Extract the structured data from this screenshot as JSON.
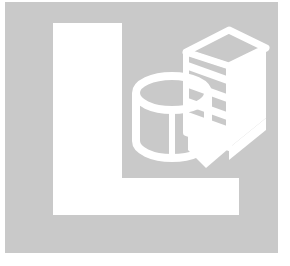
{
  "image": {
    "kind": "logo-graphic",
    "title": "L monogram with database cylinder and server tower",
    "width": 290,
    "height": 266,
    "page_background": "#ffffff"
  },
  "colors": {
    "page_background": "#ffffff",
    "plaque_gray": "#c9c9c9",
    "glyph_white": "#ffffff",
    "outline_white": "#ffffff"
  },
  "plaque": {
    "name": "gray-square-plaque",
    "x": 5,
    "y": 2,
    "width": 273,
    "height": 251,
    "fill": "#c9c9c9"
  },
  "letter": {
    "name": "letter-L",
    "character": "L",
    "fill": "#ffffff",
    "stem": {
      "x": 53,
      "y": 23,
      "width": 69,
      "height": 192
    },
    "arm": {
      "x": 53,
      "y": 178,
      "width": 186,
      "height": 37
    }
  },
  "icons": [
    {
      "name": "database-cylinder-icon",
      "label": "database cylinder",
      "style": "white-outline",
      "center_x": 172,
      "center_y": 110,
      "radius_x": 36,
      "radius_y": 17,
      "body_height": 62
    },
    {
      "name": "server-tower-icon",
      "label": "server tower with drive bays",
      "style": "white-filled-and-outline",
      "top_face": "parallelogram",
      "bay_count": 3,
      "x": 183,
      "y": 30,
      "width": 83,
      "height": 118
    }
  ],
  "accessibility": {
    "alt_text": "L monogram logo with a database cylinder and server tower",
    "role": "img"
  }
}
